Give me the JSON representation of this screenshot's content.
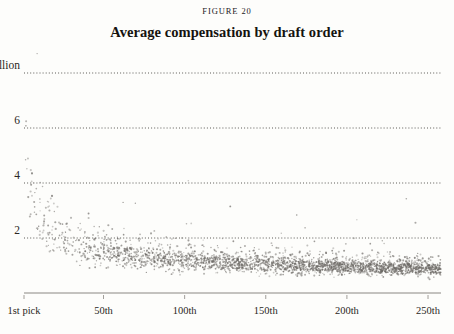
{
  "figure": {
    "label": "FIGURE 20",
    "title": "Average compensation by draft order"
  },
  "colors": {
    "background": "#fdfdfb",
    "text": "#1a1a1a",
    "point": "#6d6a66",
    "gridline": "#4a4744",
    "axis": "#8a8782"
  },
  "chart_data": {
    "type": "scatter",
    "title": "Average compensation by draft order",
    "subtitle": "FIGURE 20",
    "xlabel": "",
    "ylabel": "",
    "xlim": [
      1,
      258
    ],
    "ylim": [
      0,
      8.9
    ],
    "grid": true,
    "legend": null,
    "legend_position": "none",
    "y_ticks": [
      {
        "value": 8,
        "label": "$ 8 million"
      },
      {
        "value": 6,
        "label": "6"
      },
      {
        "value": 4,
        "label": "4"
      },
      {
        "value": 2,
        "label": "2"
      }
    ],
    "x_ticks": [
      {
        "value": 1,
        "label": "1st pick"
      },
      {
        "value": 50,
        "label": "50th"
      },
      {
        "value": 100,
        "label": "100th"
      },
      {
        "value": 150,
        "label": "150th"
      },
      {
        "value": 200,
        "label": "200th"
      },
      {
        "value": 250,
        "label": "250th"
      }
    ],
    "units": "millions of dollars",
    "trend": {
      "model": "power-decay",
      "a": 7.4,
      "b": 0.47,
      "c": 0.36,
      "note": "y = a * x^-b + c approximates the central tendency of the cloud"
    },
    "n_points": 1850,
    "point_size_px": 1.5,
    "point_opacity": 0.55,
    "series": [
      {
        "name": "Drafted players",
        "x_range": [
          1,
          258
        ],
        "scatter_spread": {
          "upper_multiplier": 2.15,
          "lower_multiplier": 0.42,
          "noise_decay": 0.55
        }
      }
    ],
    "sampled_points": [
      {
        "x": 1,
        "y": 8.45
      },
      {
        "x": 1,
        "y": 7.3
      },
      {
        "x": 2,
        "y": 6.9
      },
      {
        "x": 2,
        "y": 6.1
      },
      {
        "x": 3,
        "y": 6.4
      },
      {
        "x": 3,
        "y": 5.2
      },
      {
        "x": 4,
        "y": 5.9
      },
      {
        "x": 5,
        "y": 5.0
      },
      {
        "x": 6,
        "y": 4.6
      },
      {
        "x": 7,
        "y": 4.9
      },
      {
        "x": 8,
        "y": 4.2
      },
      {
        "x": 9,
        "y": 3.9
      },
      {
        "x": 10,
        "y": 4.0
      },
      {
        "x": 12,
        "y": 3.5
      },
      {
        "x": 14,
        "y": 3.2
      },
      {
        "x": 16,
        "y": 3.4
      },
      {
        "x": 18,
        "y": 2.9
      },
      {
        "x": 20,
        "y": 2.7
      },
      {
        "x": 24,
        "y": 2.5
      },
      {
        "x": 28,
        "y": 2.3
      },
      {
        "x": 32,
        "y": 2.1
      },
      {
        "x": 38,
        "y": 1.9
      },
      {
        "x": 45,
        "y": 1.7
      },
      {
        "x": 52,
        "y": 1.5
      },
      {
        "x": 60,
        "y": 1.35
      },
      {
        "x": 70,
        "y": 1.2
      },
      {
        "x": 80,
        "y": 1.1
      },
      {
        "x": 95,
        "y": 0.98
      },
      {
        "x": 110,
        "y": 0.9
      },
      {
        "x": 130,
        "y": 0.82
      },
      {
        "x": 150,
        "y": 0.76
      },
      {
        "x": 175,
        "y": 0.7
      },
      {
        "x": 200,
        "y": 0.65
      },
      {
        "x": 225,
        "y": 0.6
      },
      {
        "x": 250,
        "y": 0.56
      }
    ]
  },
  "geometry": {
    "plot_left": 24,
    "plot_right": 441,
    "plot_top": 8,
    "baseline_y": 293,
    "y_pixel_at_8": 73,
    "y_pixel_at_0": 293,
    "tick_len": 4,
    "tick_label_y": 305
  }
}
